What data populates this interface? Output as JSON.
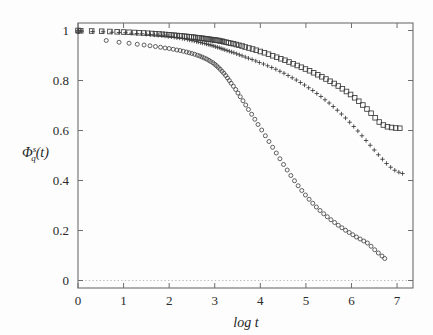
{
  "chart_data": {
    "type": "scatter",
    "title": "",
    "subtitle": "",
    "xlabel": "log t",
    "ylabel": "Φ",
    "ylabel_sub": "q",
    "ylabel_sup": "s",
    "ylabel_arg": "(t)",
    "ylabel_full": "Φ_q^s(t)",
    "xlim": [
      0,
      7.35
    ],
    "ylim": [
      -0.03,
      1.03
    ],
    "xticks": [
      0,
      1,
      2,
      3,
      4,
      5,
      6,
      7
    ],
    "xtick_labels": [
      "0",
      "1",
      "2",
      "3",
      "4",
      "5",
      "6",
      "7"
    ],
    "yticks": [
      0,
      0.2,
      0.4,
      0.6,
      0.8,
      1
    ],
    "ytick_labels": [
      "0",
      "0.2",
      "0.4",
      "0.6",
      "0.8",
      "1"
    ],
    "grid": false,
    "legend": "none",
    "reference_lines": [
      {
        "name": "zero-baseline",
        "orientation": "horizontal",
        "y": 0,
        "style": "dotted",
        "color": "#bcbcbc"
      }
    ],
    "marker_colors": {
      "squares": "#3b3b3b",
      "plus": "#3b3b3b",
      "circles": "#3b3b3b"
    },
    "series": [
      {
        "name": "squares",
        "marker": "open-square",
        "x": [
          0.0,
          0.06,
          0.3,
          0.52,
          0.7,
          0.86,
          1.0,
          1.12,
          1.24,
          1.34,
          1.44,
          1.53,
          1.62,
          1.7,
          1.78,
          1.85,
          1.92,
          1.99,
          2.05,
          2.11,
          2.17,
          2.23,
          2.28,
          2.34,
          2.39,
          2.44,
          2.49,
          2.54,
          2.58,
          2.63,
          2.67,
          2.72,
          2.76,
          2.8,
          2.84,
          2.88,
          2.92,
          2.96,
          3.0,
          3.04,
          3.08,
          3.12,
          3.16,
          3.2,
          3.25,
          3.3,
          3.35,
          3.41,
          3.47,
          3.53,
          3.6,
          3.67,
          3.75,
          3.83,
          3.91,
          4.0,
          4.09,
          4.18,
          4.27,
          4.36,
          4.45,
          4.54,
          4.63,
          4.72,
          4.81,
          4.9,
          4.99,
          5.08,
          5.17,
          5.26,
          5.35,
          5.44,
          5.53,
          5.62,
          5.71,
          5.8,
          5.89,
          5.98,
          6.07,
          6.16,
          6.25,
          6.34,
          6.43,
          6.52,
          6.61,
          6.7,
          6.79,
          6.88,
          6.97,
          7.06
        ],
        "y": [
          1.0,
          0.999,
          0.998,
          0.997,
          0.996,
          0.995,
          0.994,
          0.993,
          0.992,
          0.991,
          0.99,
          0.989,
          0.988,
          0.987,
          0.986,
          0.985,
          0.984,
          0.983,
          0.982,
          0.981,
          0.98,
          0.979,
          0.978,
          0.977,
          0.976,
          0.975,
          0.974,
          0.973,
          0.972,
          0.971,
          0.97,
          0.969,
          0.968,
          0.967,
          0.966,
          0.965,
          0.964,
          0.963,
          0.962,
          0.961,
          0.96,
          0.958,
          0.957,
          0.955,
          0.953,
          0.951,
          0.949,
          0.947,
          0.944,
          0.941,
          0.938,
          0.934,
          0.93,
          0.926,
          0.921,
          0.916,
          0.911,
          0.905,
          0.899,
          0.893,
          0.887,
          0.881,
          0.874,
          0.867,
          0.86,
          0.853,
          0.846,
          0.839,
          0.831,
          0.823,
          0.815,
          0.806,
          0.797,
          0.788,
          0.778,
          0.767,
          0.756,
          0.744,
          0.731,
          0.717,
          0.702,
          0.686,
          0.669,
          0.651,
          0.634,
          0.622,
          0.615,
          0.612,
          0.61,
          0.609
        ]
      },
      {
        "name": "plus-signs",
        "marker": "plus",
        "x": [
          0.0,
          0.08,
          0.32,
          0.55,
          0.74,
          0.9,
          1.04,
          1.17,
          1.29,
          1.4,
          1.5,
          1.59,
          1.68,
          1.76,
          1.84,
          1.91,
          1.98,
          2.05,
          2.11,
          2.17,
          2.23,
          2.29,
          2.34,
          2.4,
          2.45,
          2.5,
          2.55,
          2.6,
          2.64,
          2.69,
          2.73,
          2.78,
          2.82,
          2.86,
          2.9,
          2.94,
          2.98,
          3.02,
          3.06,
          3.1,
          3.14,
          3.18,
          3.22,
          3.27,
          3.32,
          3.37,
          3.42,
          3.48,
          3.54,
          3.6,
          3.67,
          3.74,
          3.82,
          3.9,
          3.98,
          4.07,
          4.16,
          4.25,
          4.34,
          4.43,
          4.52,
          4.61,
          4.7,
          4.79,
          4.88,
          4.97,
          5.06,
          5.15,
          5.24,
          5.33,
          5.42,
          5.51,
          5.6,
          5.69,
          5.78,
          5.87,
          5.96,
          6.05,
          6.14,
          6.23,
          6.32,
          6.41,
          6.5,
          6.59,
          6.68,
          6.77,
          6.86,
          6.95,
          7.04,
          7.12
        ],
        "y": [
          0.998,
          0.997,
          0.996,
          0.995,
          0.993,
          0.992,
          0.991,
          0.989,
          0.988,
          0.987,
          0.985,
          0.984,
          0.982,
          0.981,
          0.979,
          0.978,
          0.976,
          0.975,
          0.973,
          0.971,
          0.97,
          0.968,
          0.966,
          0.964,
          0.962,
          0.96,
          0.958,
          0.956,
          0.954,
          0.952,
          0.95,
          0.948,
          0.946,
          0.944,
          0.942,
          0.94,
          0.938,
          0.935,
          0.933,
          0.931,
          0.928,
          0.926,
          0.923,
          0.92,
          0.917,
          0.914,
          0.911,
          0.907,
          0.903,
          0.899,
          0.894,
          0.889,
          0.884,
          0.878,
          0.872,
          0.866,
          0.859,
          0.852,
          0.845,
          0.837,
          0.829,
          0.82,
          0.811,
          0.802,
          0.792,
          0.782,
          0.771,
          0.76,
          0.748,
          0.736,
          0.723,
          0.71,
          0.696,
          0.681,
          0.666,
          0.65,
          0.633,
          0.616,
          0.598,
          0.579,
          0.56,
          0.541,
          0.522,
          0.503,
          0.485,
          0.468,
          0.453,
          0.441,
          0.433,
          0.428
        ]
      },
      {
        "name": "circles",
        "marker": "open-circle",
        "x": [
          0.0,
          0.62,
          0.9,
          1.12,
          1.3,
          1.45,
          1.58,
          1.7,
          1.81,
          1.91,
          2.0,
          2.09,
          2.17,
          2.24,
          2.31,
          2.38,
          2.44,
          2.5,
          2.56,
          2.62,
          2.67,
          2.72,
          2.77,
          2.82,
          2.87,
          2.91,
          2.96,
          3.0,
          3.04,
          3.08,
          3.12,
          3.16,
          3.2,
          3.24,
          3.28,
          3.32,
          3.36,
          3.41,
          3.46,
          3.51,
          3.56,
          3.62,
          3.68,
          3.74,
          3.81,
          3.88,
          3.95,
          4.03,
          4.11,
          4.19,
          4.27,
          4.35,
          4.43,
          4.51,
          4.59,
          4.67,
          4.75,
          4.83,
          4.91,
          4.99,
          5.07,
          5.15,
          5.23,
          5.31,
          5.39,
          5.47,
          5.55,
          5.63,
          5.71,
          5.79,
          5.87,
          5.95,
          6.03,
          6.11,
          6.19,
          6.27,
          6.35,
          6.43,
          6.51,
          6.59,
          6.67,
          6.73
        ],
        "y": [
          0.995,
          0.96,
          0.953,
          0.949,
          0.945,
          0.942,
          0.939,
          0.936,
          0.933,
          0.93,
          0.928,
          0.925,
          0.922,
          0.92,
          0.917,
          0.914,
          0.911,
          0.908,
          0.905,
          0.901,
          0.898,
          0.894,
          0.89,
          0.886,
          0.881,
          0.876,
          0.871,
          0.865,
          0.859,
          0.852,
          0.845,
          0.837,
          0.829,
          0.82,
          0.81,
          0.8,
          0.789,
          0.777,
          0.764,
          0.75,
          0.735,
          0.719,
          0.702,
          0.684,
          0.665,
          0.645,
          0.624,
          0.602,
          0.579,
          0.556,
          0.533,
          0.51,
          0.487,
          0.464,
          0.442,
          0.42,
          0.399,
          0.379,
          0.36,
          0.342,
          0.325,
          0.309,
          0.294,
          0.28,
          0.267,
          0.255,
          0.243,
          0.232,
          0.221,
          0.211,
          0.201,
          0.192,
          0.183,
          0.174,
          0.166,
          0.158,
          0.15,
          0.137,
          0.123,
          0.11,
          0.098,
          0.088
        ]
      }
    ]
  }
}
